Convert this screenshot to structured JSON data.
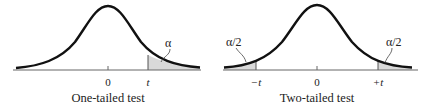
{
  "left_panel": {
    "caption": "One-tailed test",
    "center_label": "0",
    "critical_label": "t",
    "area_label": "α"
  },
  "right_panel": {
    "caption": "Two-tailed test",
    "center_label": "0",
    "left_critical_label": "−t",
    "right_critical_label": "+t",
    "left_area_label": "α/2",
    "right_area_label": "α/2"
  },
  "colors": {
    "curve": "#111111",
    "axis": "#555555",
    "shaded_tail": "#d9d9d9"
  }
}
